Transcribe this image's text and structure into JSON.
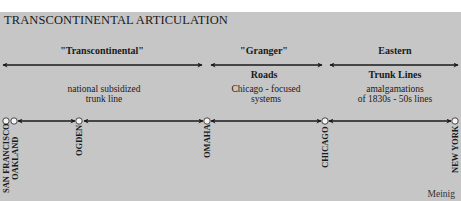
{
  "title": "TRANSCONTINENTAL ARTICULATION",
  "segments": [
    {
      "heading": "\"Transcontinental\"",
      "subheading": "",
      "description_lines": [
        "national subsidized",
        "trunk line"
      ]
    },
    {
      "heading": "\"Granger\"",
      "subheading": "Roads",
      "description_lines": [
        "Chicago - focused",
        "systems"
      ]
    },
    {
      "heading": "Eastern",
      "subheading": "Trunk Lines",
      "description_lines": [
        "amalgamations",
        "of 1830s - 50s lines"
      ]
    }
  ],
  "cities": [
    {
      "name": "SAN FRANCISCO"
    },
    {
      "name": "OAKLAND"
    },
    {
      "name": "OGDEN"
    },
    {
      "name": "OMAHA"
    },
    {
      "name": "CHICAGO"
    },
    {
      "name": "NEW YORK"
    }
  ],
  "credit": "Meinig",
  "colors": {
    "background": "#c6c6c6",
    "ink": "#1a1a1a",
    "node_fill": "#f4f4f4"
  }
}
